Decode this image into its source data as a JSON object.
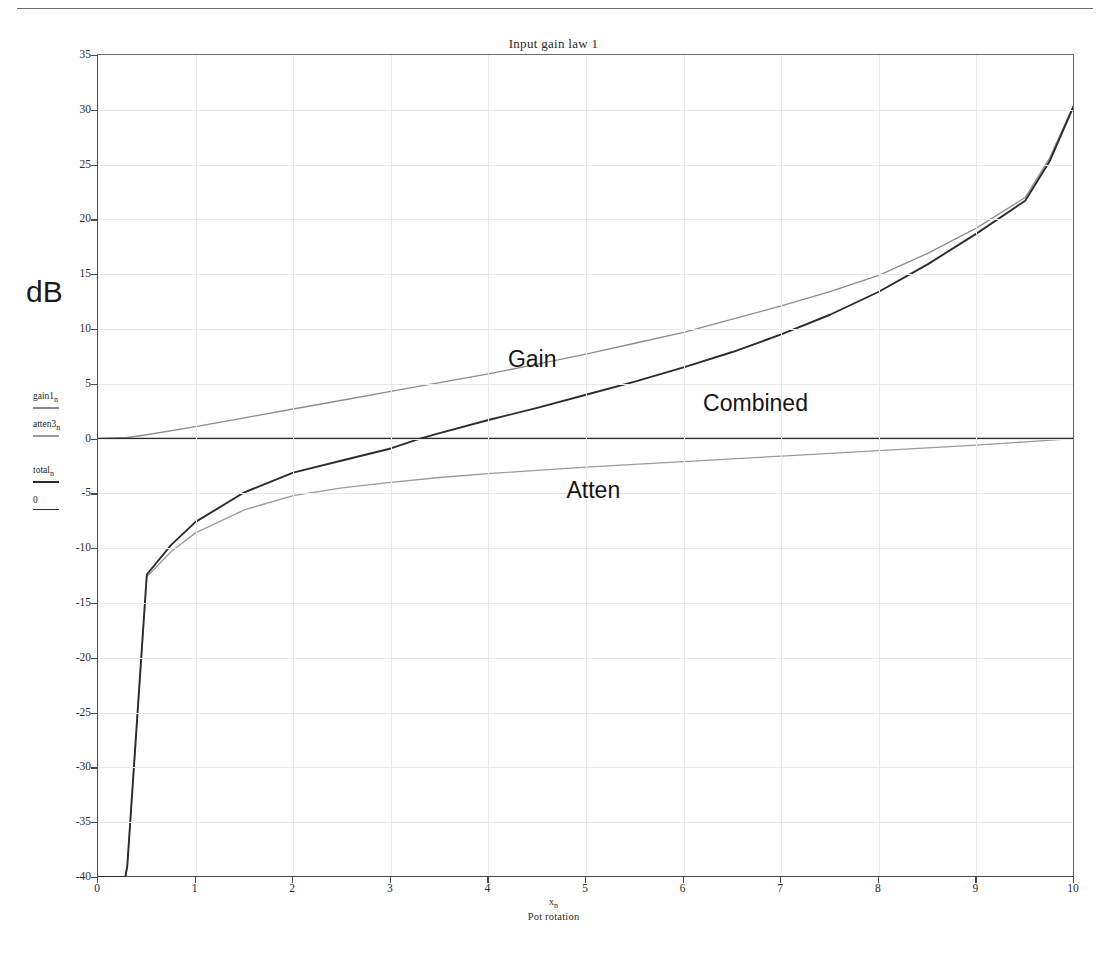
{
  "page": {
    "title": "Input gain law 1"
  },
  "chart_data": {
    "type": "line",
    "title": "Input gain law 1",
    "xlabel_symbol": "x",
    "xlabel_subscript": "n",
    "xlabel": "Pot rotation",
    "ylabel": "dB",
    "xlim": [
      0,
      10
    ],
    "ylim": [
      -40,
      35
    ],
    "xticks": [
      0,
      1,
      2,
      3,
      4,
      5,
      6,
      7,
      8,
      9,
      10
    ],
    "yticks": [
      -40,
      -35,
      -30,
      -25,
      -20,
      -15,
      -10,
      -5,
      0,
      5,
      10,
      15,
      20,
      25,
      30,
      35
    ],
    "grid": true,
    "legend_position": "left-margin",
    "annotations": [
      {
        "text": "Gain",
        "x": 4.2,
        "y": 7.0
      },
      {
        "text": "Combined",
        "x": 6.2,
        "y": 3.0
      },
      {
        "text": "Atten",
        "x": 4.8,
        "y": -5.0
      }
    ],
    "series": [
      {
        "name": "gain1",
        "label": "gain1",
        "subscript": "n",
        "display_name": "Gain",
        "color": "#8c8c8c",
        "width": 1.3,
        "x": [
          0.0,
          0.3,
          0.5,
          1.0,
          1.5,
          2.0,
          2.5,
          3.0,
          3.5,
          4.0,
          4.5,
          5.0,
          5.5,
          6.0,
          6.5,
          7.0,
          7.5,
          8.0,
          8.5,
          9.0,
          9.5,
          9.75,
          10.0
        ],
        "y": [
          0.0,
          0.1,
          0.35,
          1.1,
          1.9,
          2.7,
          3.5,
          4.3,
          5.1,
          5.9,
          6.8,
          7.7,
          8.7,
          9.7,
          10.9,
          12.1,
          13.4,
          14.9,
          16.9,
          19.2,
          22.0,
          25.6,
          30.5
        ]
      },
      {
        "name": "atten3",
        "label": "atten3",
        "subscript": "n",
        "display_name": "Atten",
        "color": "#9a9a9a",
        "width": 1.3,
        "x": [
          0.0,
          0.28,
          0.3,
          0.5,
          0.75,
          1.0,
          1.5,
          2.0,
          2.5,
          3.0,
          3.5,
          4.0,
          4.5,
          5.0,
          5.5,
          6.0,
          6.5,
          7.0,
          7.5,
          8.0,
          8.5,
          9.0,
          9.5,
          10.0
        ],
        "y": [
          -40.0,
          -40.0,
          -39.0,
          -12.6,
          -10.3,
          -8.6,
          -6.5,
          -5.2,
          -4.5,
          -4.0,
          -3.55,
          -3.2,
          -2.9,
          -2.6,
          -2.35,
          -2.1,
          -1.85,
          -1.6,
          -1.35,
          -1.1,
          -0.85,
          -0.6,
          -0.3,
          0.0
        ]
      },
      {
        "name": "total",
        "label": "total",
        "subscript": "n",
        "display_name": "Combined",
        "color": "#2c2c2c",
        "width": 1.9,
        "x": [
          0.0,
          0.28,
          0.3,
          0.5,
          0.75,
          1.0,
          1.5,
          2.0,
          2.5,
          3.0,
          3.3,
          3.5,
          4.0,
          4.5,
          5.0,
          5.5,
          6.0,
          6.5,
          7.0,
          7.5,
          8.0,
          8.5,
          9.0,
          9.5,
          9.75,
          10.0
        ],
        "y": [
          -40.0,
          -40.0,
          -39.0,
          -12.4,
          -9.7,
          -7.6,
          -4.9,
          -3.1,
          -2.0,
          -0.9,
          0.0,
          0.5,
          1.7,
          2.8,
          4.0,
          5.2,
          6.5,
          7.9,
          9.5,
          11.3,
          13.4,
          15.9,
          18.7,
          21.7,
          25.3,
          30.4
        ]
      },
      {
        "name": "zero",
        "label": "0",
        "subscript": "",
        "display_name": "Zero line",
        "color": "#2a2a2a",
        "width": 1.8,
        "x": [
          0.0,
          10.0
        ],
        "y": [
          0.0,
          0.0
        ]
      }
    ]
  },
  "legend": [
    {
      "label": "gain1",
      "sub": "n",
      "color": "#8c8c8c"
    },
    {
      "label": "atten3",
      "sub": "n",
      "color": "#9a9a9a"
    },
    {
      "label": "total",
      "sub": "n",
      "color": "#2c2c2c"
    },
    {
      "label": "0",
      "sub": "",
      "color": "#2a2a2a"
    }
  ]
}
